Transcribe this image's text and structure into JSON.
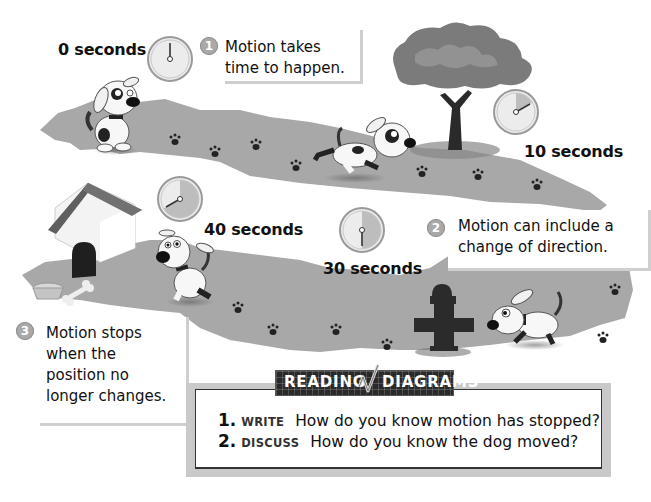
{
  "diagram": {
    "colors": {
      "path": "#a8a8a8",
      "path_shadow": "#8d8d8d",
      "clock_face": "#ececec",
      "clock_sector": "#bdbdbd",
      "clock_rim": "#9a9a9a",
      "text": "#111111",
      "badge": "#a9a9a9",
      "banner_bg": "#2a2a2a"
    },
    "time_markers": [
      {
        "label": "0 seconds",
        "seconds": 0
      },
      {
        "label": "10 seconds",
        "seconds": 10
      },
      {
        "label": "30 seconds",
        "seconds": 30
      },
      {
        "label": "40 seconds",
        "seconds": 40
      }
    ],
    "callouts": [
      {
        "number": "1",
        "lines": [
          "Motion takes",
          "time to happen."
        ]
      },
      {
        "number": "2",
        "lines": [
          "Motion can include a",
          "change of direction."
        ]
      },
      {
        "number": "3",
        "lines": [
          "Motion stops",
          "when the",
          "position no",
          "longer changes."
        ]
      }
    ],
    "scene_objects": [
      "dog-sitting",
      "dog-running",
      "tree",
      "doghouse",
      "food-bowl",
      "bone",
      "fire-hydrant",
      "dog-walking-left",
      "dog-walking-right",
      "paw-prints"
    ]
  },
  "reading_diagrams": {
    "banner_left": "READING",
    "banner_right": "DIAGRAMS",
    "banner_icon": "checkmark-icon",
    "questions": [
      {
        "number": "1.",
        "verb": "WRITE",
        "text": "How do you know motion has stopped?"
      },
      {
        "number": "2.",
        "verb": "DISCUSS",
        "text": "How do you know the dog moved?"
      }
    ]
  }
}
